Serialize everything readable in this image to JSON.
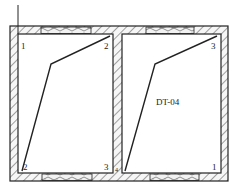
{
  "diagram": {
    "type": "structural-plan-section",
    "rooms": [
      {
        "id": "left-room",
        "corner_labels": {
          "top_left": "1",
          "top_right": "2",
          "bottom_left": "2",
          "bottom_right": "3"
        },
        "polyline": [
          [
            110,
            36
          ],
          [
            51,
            64
          ],
          [
            22,
            171
          ]
        ]
      },
      {
        "id": "right-room",
        "code": "DT-04",
        "corner_labels": {
          "top_right": "3",
          "bottom_right": "1",
          "bottom_left": "4"
        },
        "polyline": [
          [
            217,
            36
          ],
          [
            155,
            64
          ],
          [
            125,
            171
          ]
        ]
      }
    ],
    "colors": {
      "line": "#222222",
      "hatch": "#555555",
      "background": "#ffffff"
    }
  }
}
